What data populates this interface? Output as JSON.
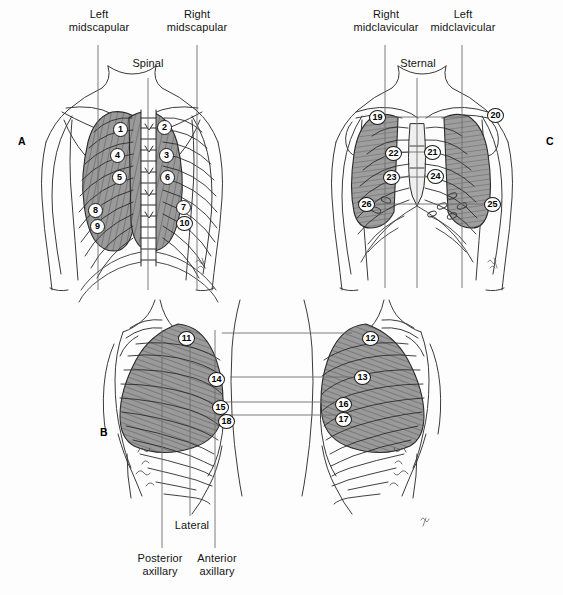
{
  "figure": {
    "background_color": "#fdfdfd",
    "ink_color": "#1a1a1a",
    "lung_shade_color": "#8c8c8c"
  },
  "panels": [
    {
      "id": "A",
      "letter": "A",
      "view": "posterior",
      "x": 18,
      "y": 135
    },
    {
      "id": "B",
      "letter": "B",
      "view": "lateral",
      "x": 100,
      "y": 426
    },
    {
      "id": "C",
      "letter": "C",
      "view": "anterior",
      "x": 546,
      "y": 135
    }
  ],
  "panel_a": {
    "labels": [
      {
        "name": "left-midscapular",
        "text": "Left\nmidscapular",
        "x": 68,
        "y": 8,
        "w": 62,
        "line_x": 98,
        "line_y1": 45,
        "line_y2": 290
      },
      {
        "name": "spinal",
        "text": "Spinal",
        "x": 125,
        "y": 57,
        "w": 46,
        "line_x": 148,
        "line_y1": 78,
        "line_y2": 290
      },
      {
        "name": "right-midscapular",
        "text": "Right\nmidscapular",
        "x": 166,
        "y": 8,
        "w": 62,
        "line_x": 197,
        "line_y1": 45,
        "line_y2": 290
      }
    ],
    "sites": [
      {
        "n": "1",
        "x": 113,
        "y": 122
      },
      {
        "n": "2",
        "x": 157,
        "y": 120
      },
      {
        "n": "3",
        "x": 159,
        "y": 148
      },
      {
        "n": "4",
        "x": 110,
        "y": 148
      },
      {
        "n": "5",
        "x": 112,
        "y": 170
      },
      {
        "n": "6",
        "x": 160,
        "y": 170
      },
      {
        "n": "7",
        "x": 176,
        "y": 200
      },
      {
        "n": "8",
        "x": 88,
        "y": 203
      },
      {
        "n": "9",
        "x": 90,
        "y": 219
      },
      {
        "n": "10",
        "x": 176,
        "y": 216
      }
    ]
  },
  "panel_b": {
    "labels": [
      {
        "name": "lateral",
        "text": "Lateral",
        "x": 169,
        "y": 519,
        "w": 46,
        "line_x": 190,
        "line_y1": 330,
        "line_y2": 516
      },
      {
        "name": "posterior-axillary",
        "text": "Posterior\naxillary",
        "x": 128,
        "y": 552,
        "w": 64,
        "line_x": 162,
        "line_y1": 330,
        "line_y2": 548
      },
      {
        "name": "anterior-axillary",
        "text": "Anterior\naxillary",
        "x": 186,
        "y": 552,
        "w": 62,
        "line_x": 215,
        "line_y1": 330,
        "line_y2": 548
      }
    ],
    "connectors": [
      {
        "y": 333,
        "x1": 222,
        "x2": 352
      },
      {
        "y": 377,
        "x1": 230,
        "x2": 352
      },
      {
        "y": 402,
        "x1": 222,
        "x2": 352
      },
      {
        "y": 415,
        "x1": 222,
        "x2": 352
      }
    ],
    "sites": [
      {
        "n": "11",
        "x": 178,
        "y": 331
      },
      {
        "n": "12",
        "x": 362,
        "y": 331
      },
      {
        "n": "13",
        "x": 354,
        "y": 370
      },
      {
        "n": "14",
        "x": 208,
        "y": 372
      },
      {
        "n": "15",
        "x": 212,
        "y": 400
      },
      {
        "n": "16",
        "x": 335,
        "y": 397
      },
      {
        "n": "17",
        "x": 335,
        "y": 412
      },
      {
        "n": "18",
        "x": 218,
        "y": 414
      }
    ]
  },
  "panel_c": {
    "labels": [
      {
        "name": "right-midclavicular",
        "text": "Right\nmidclavicular",
        "x": 351,
        "y": 8,
        "w": 70,
        "line_x": 385,
        "line_y1": 45,
        "line_y2": 288
      },
      {
        "name": "sternal",
        "text": "Sternal",
        "x": 394,
        "y": 57,
        "w": 48,
        "line_x": 417,
        "line_y1": 78,
        "line_y2": 288
      },
      {
        "name": "left-midclavicular",
        "text": "Left\nmidclavicular",
        "x": 428,
        "y": 8,
        "w": 70,
        "line_x": 462,
        "line_y1": 45,
        "line_y2": 288
      }
    ],
    "connectors": [
      {
        "y": 117,
        "x1": 375,
        "x2": 466
      },
      {
        "y": 152,
        "x1": 392,
        "x2": 437
      },
      {
        "y": 177,
        "x1": 387,
        "x2": 440
      },
      {
        "y": 204,
        "x1": 368,
        "x2": 498
      }
    ],
    "sites": [
      {
        "n": "19",
        "x": 369,
        "y": 110
      },
      {
        "n": "20",
        "x": 487,
        "y": 108
      },
      {
        "n": "21",
        "x": 424,
        "y": 145
      },
      {
        "n": "22",
        "x": 385,
        "y": 146
      },
      {
        "n": "23",
        "x": 383,
        "y": 170
      },
      {
        "n": "24",
        "x": 427,
        "y": 169
      },
      {
        "n": "25",
        "x": 484,
        "y": 197
      },
      {
        "n": "26",
        "x": 358,
        "y": 197
      }
    ]
  }
}
